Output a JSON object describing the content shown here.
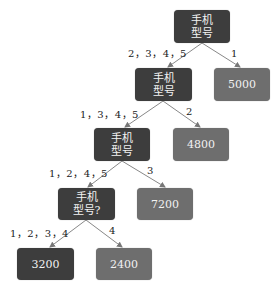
{
  "diagram": {
    "type": "decision-tree",
    "nodes": {
      "root": {
        "text": "手机\n型号",
        "kind": "decision"
      },
      "n2": {
        "text": "手机\n型号",
        "kind": "decision"
      },
      "leaf5000": {
        "text": "5000",
        "kind": "leaf"
      },
      "n3": {
        "text": "手机\n型号",
        "kind": "decision"
      },
      "leaf4800": {
        "text": "4800",
        "kind": "leaf"
      },
      "n4": {
        "text": "手机\n型号?",
        "kind": "decision"
      },
      "leaf7200": {
        "text": "7200",
        "kind": "leaf"
      },
      "leaf3200": {
        "text": "3200",
        "kind": "leaf"
      },
      "leaf2400": {
        "text": "2400",
        "kind": "leaf"
      }
    },
    "edges": [
      {
        "from": "root",
        "to": "n2",
        "label": "2，3，4，5"
      },
      {
        "from": "root",
        "to": "leaf5000",
        "label": "1"
      },
      {
        "from": "n2",
        "to": "n3",
        "label": "1，3，4，5"
      },
      {
        "from": "n2",
        "to": "leaf4800",
        "label": "2"
      },
      {
        "from": "n3",
        "to": "n4",
        "label": "1，2，4，5"
      },
      {
        "from": "n3",
        "to": "leaf7200",
        "label": "3"
      },
      {
        "from": "n4",
        "to": "leaf3200",
        "label": "1，2，3，4"
      },
      {
        "from": "n4",
        "to": "leaf2400",
        "label": "4"
      }
    ],
    "colors": {
      "decision": "#3d3d3d",
      "leaf": "#6e6e6e",
      "edge": "#777777"
    }
  }
}
